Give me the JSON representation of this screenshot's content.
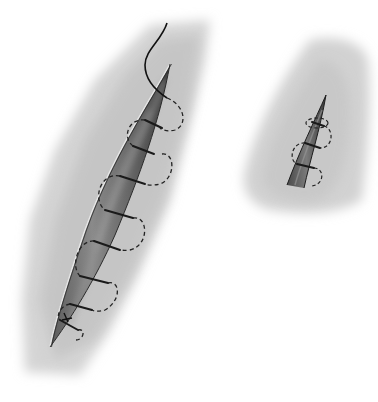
{
  "figure": {
    "panels": [
      {
        "id": "left",
        "subject": "long elliptical wound with running suture, needle thread exiting at top",
        "stitch_count": 7
      },
      {
        "id": "right",
        "subject": "small tapered wound with running suture",
        "stitch_count": 3
      }
    ],
    "colors": {
      "background": "#ffffff",
      "skin_shade": "#c8c8c8",
      "skin_light": "#e2e2e2",
      "wound_dark": "#4a4a4a",
      "wound_mid": "#7a7a7a",
      "wound_highlight": "#a8a8a8",
      "suture": "#1a1a1a"
    }
  }
}
